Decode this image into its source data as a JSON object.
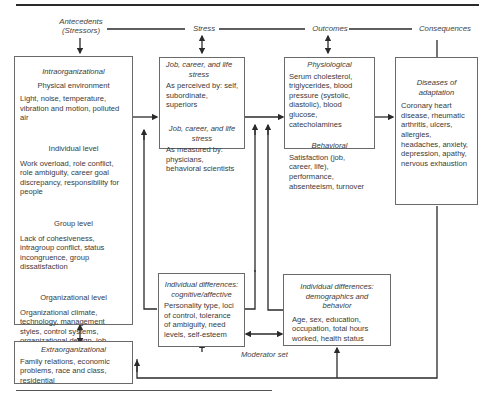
{
  "headers": {
    "antecedents": "Antecedents",
    "antecedents_sub": "(Stressors)",
    "stress": "Stress",
    "outcomes": "Outcomes",
    "consequences": "Consequences"
  },
  "intraorganizational": {
    "title": "Intraorganizational",
    "levels": [
      {
        "label": "Physical environment",
        "text": "Light, noise, temperature, vibration and motion, polluted air"
      },
      {
        "label": "Individual level",
        "text": "Work overload, role  conflict, role ambiguity, career goal discrepancy, responsibility for people"
      },
      {
        "label": "Group level",
        "text": "Lack of cohesiveness, intragroup conflict, status incongruence, group dissatisfaction"
      },
      {
        "label": "Organizational level",
        "text": "Organizational climate, technology, management styles, control systems, organizational design, job design, job characteristics"
      }
    ]
  },
  "extraorganizational": {
    "title": "Extraorganizational",
    "text": "Family relations, economic problems, race and class, residential"
  },
  "stress_box": {
    "perceived_title": "Job, career, and life stress",
    "perceived_text": "As perceived by: self, subordinate, superiors",
    "measured_title": "Job, career, and life stress",
    "measured_text": "As measured by: physicians, behavioral scientists"
  },
  "outcomes_box": {
    "physiological_title": "Physiological",
    "physiological_text": "Serum cholesterol, triglycerides, blood pressure (systolic, diastolic), blood glucose, catecholamines",
    "behavioral_title": "Behavioral",
    "behavioral_text": "Satisfaction (job, career, life), performance, absenteeism, turnover"
  },
  "consequences_box": {
    "title": "Diseases of adaptation",
    "text": "Coronary heart disease, rheumatic arthritis, ulcers, allergies, headaches, anxiety, depression, apathy, nervous exhaustion"
  },
  "moderator_cognitive": {
    "title": "Individual differences: cognitive/affective",
    "text": "Personality type, loci of control, tolerance of ambiguity, need levels, self-esteem"
  },
  "moderator_demographic": {
    "title": "Individual differences: demographics and behavior",
    "text": "Age, sex, education, occupation, total hours worked, health status"
  },
  "moderator_label": "Moderator set",
  "colors": {
    "line": "#2a2a2a",
    "box_border": "#6a6a6a",
    "text": "#3a3a3a"
  }
}
